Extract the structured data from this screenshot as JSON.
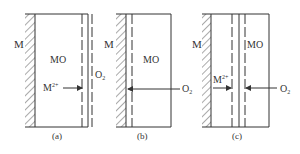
{
  "panels": [
    {
      "id": "a",
      "caption": "(a)",
      "metal_label": "M",
      "oxide_label": "MO",
      "arrow_label": "M",
      "arrow_label_sup": "2+",
      "gas_label": "O",
      "gas_label_sub": "2"
    },
    {
      "id": "b",
      "caption": "(b)",
      "metal_label": "M",
      "oxide_label": "MO",
      "gas_label": "O",
      "gas_label_sub": "2"
    },
    {
      "id": "c",
      "caption": "(c)",
      "metal_label": "M",
      "oxide_label": "MO",
      "arrow_label": "M",
      "arrow_label_sup": "2+",
      "gas_label": "O",
      "gas_label_sub": "2"
    }
  ],
  "colors": {
    "line": "#333333",
    "hatch": "#555555"
  }
}
